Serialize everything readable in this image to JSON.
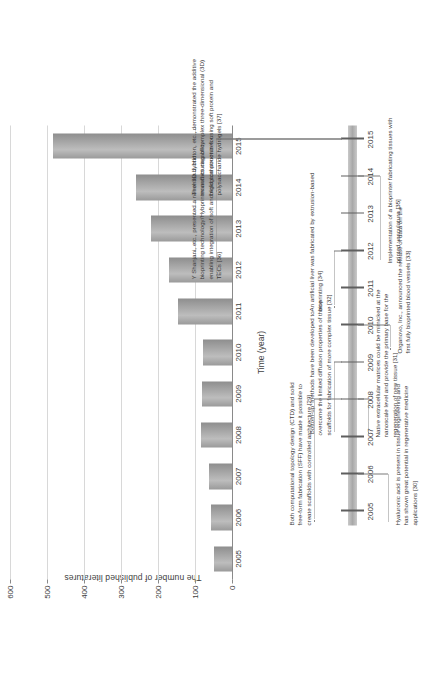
{
  "chart_data": {
    "type": "bar",
    "title": "",
    "xlabel": "Time (year)",
    "ylabel": "The number of published literatures",
    "categories": [
      "2005",
      "2006",
      "2007",
      "2008",
      "2009",
      "2010",
      "2011",
      "2012",
      "2013",
      "2014",
      "2015"
    ],
    "values": [
      50,
      57,
      62,
      85,
      80,
      78,
      145,
      170,
      220,
      260,
      485
    ],
    "ylim": [
      0,
      600
    ],
    "yticks": [
      "0",
      "100",
      "200",
      "300",
      "400",
      "500",
      "600"
    ],
    "ytick_values": [
      0,
      100,
      200,
      300,
      400,
      500,
      600
    ],
    "grid": true,
    "legend": "none",
    "bar_color": "#a5a5a5"
  },
  "timeline": {
    "years": [
      "2005",
      "2006",
      "2007",
      "2008",
      "2009",
      "2010",
      "2011",
      "2012",
      "2013",
      "2014",
      "2015"
    ],
    "notes": [
      {
        "id": "note-hyaluronic-acid",
        "year": "2006",
        "text": "Hyaluronic acid is present in tissue engineering and has shown great potential in regenerative medicine applications [30]",
        "side": "below"
      },
      {
        "id": "note-native-ecm",
        "year": "2008",
        "text": "Native extracellular matrices could be mimicked at the nanoscale level and provide the primary base for the regeneration of new tissue [31]",
        "side": "below"
      },
      {
        "id": "note-bottom-up",
        "year": "2009",
        "text": "'Bottom-up' methods have been developed to overcome the limited diffusion properties of these scaffolds for fabrication of more complex tissue [32]",
        "side": "above"
      },
      {
        "id": "note-ctd-sff",
        "year": "2008",
        "text": "Both computational topology design (CTD) and solid free-form fabrication (SFF) have made it possible to create scaffolds with controlled architecture [29]",
        "side": "above"
      },
      {
        "id": "note-organovo",
        "year": "2010",
        "text": "Organovo, Inc., announced the release of data on the first fully bioprinted blood vessels [33]",
        "side": "below"
      },
      {
        "id": "note-artificial-liver",
        "year": "2012",
        "text": "An artificial liver was fabricated by extrusion-based bioprinting [34]",
        "side": "above"
      },
      {
        "id": "note-bioprinter-vasculature",
        "year": "2014",
        "text": "Implementation of a bioprinter fabricating tissues with printed vasculature [35]",
        "side": "below"
      },
      {
        "id": "note-shanjani",
        "year": "2015",
        "text": "Y Shanjani, etc., presented a novel 3D hybrid bioprinting technology/Hybprinter and its capability enabling integration of soft and rigid components for TECs [36]",
        "side": "above"
      },
      {
        "id": "note-hinton",
        "year": "2015",
        "text": "Thomas J. Hinton, etc., demonstrated the additive manufacturing of complex three-dimensional (3D) biological structures using soft protein and polysaccharide hydrogels [37]",
        "side": "above"
      }
    ]
  }
}
